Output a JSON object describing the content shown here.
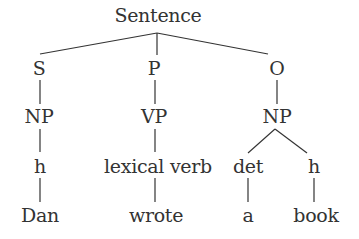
{
  "diagram": {
    "type": "syntax-tree",
    "root": {
      "label": "Sentence"
    },
    "level1": [
      {
        "label": "S"
      },
      {
        "label": "P"
      },
      {
        "label": "O"
      }
    ],
    "level2": [
      {
        "label": "NP"
      },
      {
        "label": "VP"
      },
      {
        "label": "NP"
      }
    ],
    "level3": [
      {
        "label": "h"
      },
      {
        "label": "lexical verb"
      },
      {
        "label": "det"
      },
      {
        "label": "h"
      }
    ],
    "level4": [
      {
        "label": "Dan"
      },
      {
        "label": "wrote"
      },
      {
        "label": "a"
      },
      {
        "label": "book"
      }
    ],
    "colors": {
      "text": "#333333",
      "lines": "#333333",
      "background": "#ffffff"
    }
  }
}
